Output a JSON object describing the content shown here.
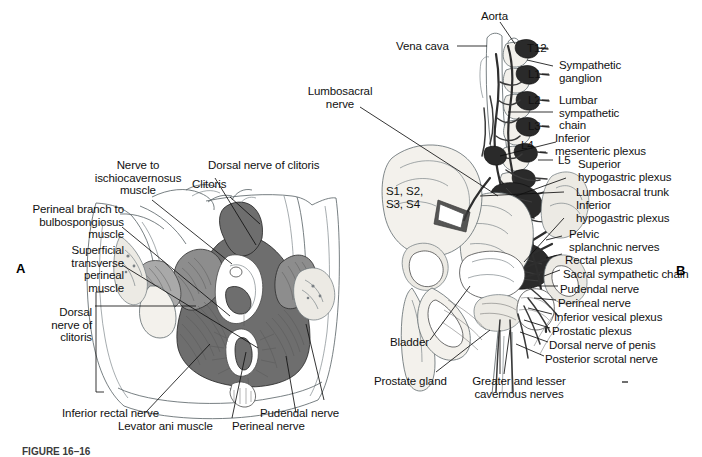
{
  "figure": {
    "caption": "FIGURE 16–16",
    "panels": [
      {
        "letter": "A",
        "name": "female-perineum-panel"
      },
      {
        "letter": "B",
        "name": "male-pelvic-autonomic-panel"
      }
    ]
  },
  "panel_a": {
    "letter": "A",
    "labels": [
      {
        "id": "nerve-to-ischiocavernosus-muscle",
        "text": "Nerve to\nischiocavernosus\nmuscle",
        "align": "center"
      },
      {
        "id": "dorsal-nerve-of-clitoris-top",
        "text": "Dorsal nerve of clitoris",
        "align": "left"
      },
      {
        "id": "clitoris",
        "text": "Clitoris",
        "align": "left"
      },
      {
        "id": "perineal-branch-to-bulbospongiosus-muscle",
        "text": "Perineal branch to\nbulbospongiosus\nmuscle",
        "align": "right"
      },
      {
        "id": "superficial-transverse-perineal-muscle",
        "text": "Superficial\ntransverse\nperineal\nmuscle",
        "align": "right"
      },
      {
        "id": "dorsal-nerve-of-clitoris-left",
        "text": "Dorsal\nnerve of\nclitoris",
        "align": "right"
      },
      {
        "id": "inferior-rectal-nerve",
        "text": "Inferior rectal nerve",
        "align": "left"
      },
      {
        "id": "levator-ani-muscle",
        "text": "Levator ani muscle",
        "align": "left"
      },
      {
        "id": "pudendal-nerve",
        "text": "Pudendal nerve",
        "align": "left"
      },
      {
        "id": "perineal-nerve",
        "text": "Perineal nerve",
        "align": "left"
      }
    ]
  },
  "panel_b": {
    "letter": "B",
    "labels": [
      {
        "id": "aorta",
        "text": "Aorta",
        "align": "left"
      },
      {
        "id": "vena-cava",
        "text": "Vena cava",
        "align": "left"
      },
      {
        "id": "t12",
        "text": "T12",
        "align": "left"
      },
      {
        "id": "sympathetic-ganglion",
        "text": "Sympathetic\nganglion",
        "align": "left"
      },
      {
        "id": "l1",
        "text": "L1",
        "align": "left"
      },
      {
        "id": "l2",
        "text": "L2",
        "align": "left"
      },
      {
        "id": "lumbar-sympathetic-chain",
        "text": "Lumbar\nsympathetic\nchain",
        "align": "left"
      },
      {
        "id": "l3",
        "text": "L3",
        "align": "left"
      },
      {
        "id": "l4",
        "text": "L4",
        "align": "left"
      },
      {
        "id": "l5",
        "text": "L5",
        "align": "left"
      },
      {
        "id": "inferior-mesenteric-plexus",
        "text": "Inferior\nmesenteric plexus",
        "align": "left"
      },
      {
        "id": "superior-hypogastric-plexus",
        "text": "Superior\nhypogastric plexus",
        "align": "left"
      },
      {
        "id": "lumbosacral-trunk",
        "text": "Lumbosacral trunk",
        "align": "left"
      },
      {
        "id": "inferior-hypogastric-plexus",
        "text": "Inferior\nhypogastric plexus",
        "align": "left"
      },
      {
        "id": "pelvic-splanchnic-nerves",
        "text": "Pelvic\nsplanchnic nerves",
        "align": "left"
      },
      {
        "id": "rectal-plexus",
        "text": "Rectal plexus",
        "align": "left"
      },
      {
        "id": "sacral-sympathetic-chain",
        "text": "Sacral sympathetic chain",
        "align": "left"
      },
      {
        "id": "pudendal-nerve",
        "text": "Pudendal nerve",
        "align": "left"
      },
      {
        "id": "perineal-nerve",
        "text": "Perineal nerve",
        "align": "left"
      },
      {
        "id": "inferior-vesical-plexus",
        "text": "Inferior vesical plexus",
        "align": "left"
      },
      {
        "id": "prostatic-plexus",
        "text": "Prostatic plexus",
        "align": "left"
      },
      {
        "id": "dorsal-nerve-of-penis",
        "text": "Dorsal nerve of penis",
        "align": "left"
      },
      {
        "id": "posterior-scrotal-nerve",
        "text": "Posterior scrotal nerve",
        "align": "left"
      },
      {
        "id": "lumbosacral-nerve",
        "text": "Lumbosacral\nnerve",
        "align": "center"
      },
      {
        "id": "sacral-roots",
        "text": "S1, S2,\nS3, S4",
        "align": "left"
      },
      {
        "id": "bladder",
        "text": "Bladder",
        "align": "left"
      },
      {
        "id": "prostate-gland",
        "text": "Prostate gland",
        "align": "left"
      },
      {
        "id": "greater-and-lesser-cavernous-nerves",
        "text": "Greater and lesser\ncavernous nerves",
        "align": "center"
      }
    ]
  },
  "colors": {
    "background": "#ffffff",
    "text": "#111111",
    "leader_line": "#111111",
    "bone_fill": "#f3f1ec",
    "muscle_fill": "#8d8d8d",
    "muscle_dark": "#6e6e6e",
    "nerve": "#2e2e2e",
    "outline": "#555f63",
    "caption": "#3b3b3b"
  }
}
